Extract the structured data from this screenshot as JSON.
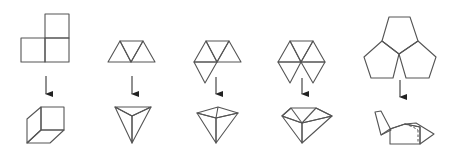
{
  "figure": {
    "description": "Five polygon nets (top row) each with a downward arrow to the 3D solid corner/vertex they fold into (bottom row)",
    "colors": {
      "background": "#ffffff",
      "stroke": "#555555",
      "fill_light": "#e6e6e6",
      "fill_mid": "#dcdcdc",
      "fill_dark": "#cfcfcf",
      "arrow": "#222222"
    },
    "columns": [
      {
        "id": "squares",
        "net": "3 squares in an L-shape",
        "result": "cube corner (3 squares meeting at a vertex)"
      },
      {
        "id": "triangles-3",
        "net": "3 equilateral triangles in a strip",
        "result": "triangular pyramid vertex (3 triangles)"
      },
      {
        "id": "triangles-4",
        "net": "4 equilateral triangles around a point",
        "result": "square pyramid vertex (4 triangles)"
      },
      {
        "id": "triangles-5",
        "net": "5 equilateral triangles around a point",
        "result": "pentagonal pyramid vertex (5 triangles)"
      },
      {
        "id": "pentagons-3",
        "net": "3 regular pentagons meeting at a point",
        "result": "dodecahedron corner (3 pentagons)"
      }
    ]
  }
}
